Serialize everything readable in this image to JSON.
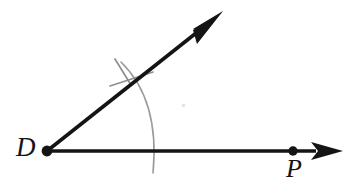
{
  "figure": {
    "type": "geometry-diagram",
    "width": 357,
    "height": 195,
    "background_color": "#ffffff"
  },
  "labels": {
    "vertex": "D",
    "point_on_ray": "P"
  },
  "colors": {
    "ink": "#141414",
    "arc": "#9a9a9a",
    "tick": "#8f8f8f",
    "speck": "#e2e2e2",
    "background": "#ffffff"
  },
  "geometry": {
    "vertex": {
      "name": "D",
      "x": 47,
      "y": 151,
      "dot_radius": 5.2
    },
    "ray_horizontal": {
      "name": "ray-DP",
      "from_x": 47,
      "from_y": 151,
      "to_x": 313,
      "to_y": 151,
      "stroke_width": 3.4,
      "arrow_tip_x": 343,
      "arrow_tip_y": 151,
      "arrow_length": 31,
      "arrow_half_width": 9,
      "point_P": {
        "name": "P",
        "x": 293,
        "y": 151,
        "dot_radius": 4.6
      }
    },
    "ray_upper": {
      "name": "ray-upper",
      "from_x": 47,
      "from_y": 151,
      "to_x": 200,
      "to_y": 30,
      "stroke_width": 3.6,
      "arrow_tip_x": 223,
      "arrow_tip_y": 11,
      "arrow_length": 33,
      "arrow_half_width": 8,
      "angle_degrees": 38.5
    },
    "compass_arc": {
      "name": "compass-arc",
      "center_x": 47,
      "center_y": 151,
      "radius": 116,
      "start_x": 121,
      "start_y": 62,
      "end_x": 153,
      "end_y": 173,
      "stroke_width": 1.5
    },
    "tick_mark": {
      "name": "arc-tick-mark",
      "stroke_width": 1.6,
      "segment_a": {
        "x1": 115,
        "y1": 59,
        "x2": 131,
        "y2": 84
      },
      "segment_b": {
        "x1": 110,
        "y1": 85,
        "x2": 152,
        "y2": 73
      }
    },
    "speck": {
      "x": 183,
      "y": 105,
      "size": 3
    }
  }
}
